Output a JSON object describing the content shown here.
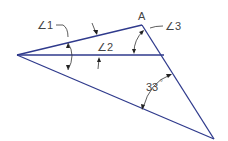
{
  "diagram": {
    "type": "geometry-angles",
    "labels": {
      "angle1": "∠1",
      "angle2": "∠2",
      "angle3": "∠3",
      "point_a": "A",
      "angle_value": "33",
      "degree_symbol": "°"
    },
    "colors": {
      "lines": "#2f3a8c",
      "dimension_lines": "#333333",
      "text": "#444444"
    }
  }
}
